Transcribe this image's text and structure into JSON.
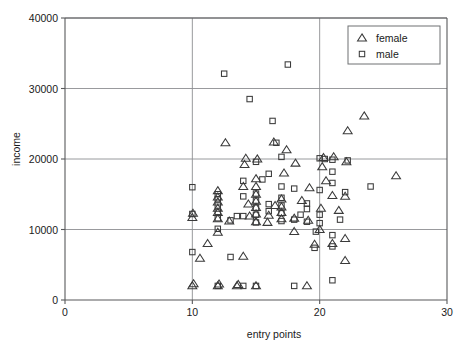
{
  "chart_data": {
    "type": "scatter",
    "title": "",
    "xlabel": "entry points",
    "ylabel": "income",
    "xlim": [
      0,
      30
    ],
    "ylim": [
      0,
      40000
    ],
    "xticks": [
      0,
      10,
      20,
      30
    ],
    "yticks": [
      0,
      10000,
      20000,
      30000,
      40000
    ],
    "xtick_labels": [
      "0",
      "10",
      "20",
      "30"
    ],
    "ytick_labels": [
      "0",
      "10000",
      "20000",
      "30000",
      "40000"
    ],
    "grid": "both-major",
    "legend_position": "top-right",
    "series": [
      {
        "name": "female",
        "marker": "triangle",
        "color": "#3a3a3a",
        "points": [
          [
            10.0,
            2000
          ],
          [
            10.1,
            2300
          ],
          [
            10.0,
            11700
          ],
          [
            10.05,
            12300
          ],
          [
            10.6,
            5900
          ],
          [
            11.2,
            8000
          ],
          [
            12.0,
            2000
          ],
          [
            12.1,
            2250
          ],
          [
            12.0,
            9600
          ],
          [
            12.0,
            11500
          ],
          [
            12.0,
            12400
          ],
          [
            12.0,
            13000
          ],
          [
            12.0,
            13900
          ],
          [
            12.0,
            14600
          ],
          [
            12.0,
            15500
          ],
          [
            12.6,
            22300
          ],
          [
            12.9,
            11200
          ],
          [
            13.5,
            2000
          ],
          [
            13.6,
            2200
          ],
          [
            14.0,
            6200
          ],
          [
            14.0,
            16100
          ],
          [
            14.1,
            19200
          ],
          [
            14.2,
            20100
          ],
          [
            14.4,
            13600
          ],
          [
            14.5,
            11900
          ],
          [
            15.0,
            2000
          ],
          [
            15.0,
            11100
          ],
          [
            15.0,
            12200
          ],
          [
            15.0,
            13100
          ],
          [
            15.0,
            14000
          ],
          [
            15.0,
            15000
          ],
          [
            15.0,
            16100
          ],
          [
            15.0,
            17200
          ],
          [
            15.1,
            20000
          ],
          [
            15.9,
            11000
          ],
          [
            16.0,
            12000
          ],
          [
            16.4,
            22400
          ],
          [
            16.5,
            13400
          ],
          [
            17.0,
            11500
          ],
          [
            17.0,
            12400
          ],
          [
            17.0,
            13200
          ],
          [
            17.0,
            14300
          ],
          [
            17.2,
            18000
          ],
          [
            17.4,
            21300
          ],
          [
            18.0,
            9700
          ],
          [
            18.0,
            11600
          ],
          [
            18.1,
            19400
          ],
          [
            18.6,
            14100
          ],
          [
            19.0,
            2000
          ],
          [
            19.1,
            11300
          ],
          [
            19.2,
            15900
          ],
          [
            19.6,
            7900
          ],
          [
            20.0,
            10000
          ],
          [
            20.1,
            13000
          ],
          [
            20.2,
            18900
          ],
          [
            20.3,
            20200
          ],
          [
            20.5,
            16900
          ],
          [
            21.0,
            8000
          ],
          [
            21.0,
            14800
          ],
          [
            21.1,
            20300
          ],
          [
            21.5,
            12700
          ],
          [
            22.0,
            5600
          ],
          [
            22.0,
            8700
          ],
          [
            22.0,
            14700
          ],
          [
            22.1,
            19600
          ],
          [
            22.2,
            24000
          ],
          [
            23.5,
            26100
          ],
          [
            26.0,
            17600
          ]
        ]
      },
      {
        "name": "male",
        "marker": "square",
        "color": "#3a3a3a",
        "points": [
          [
            10.0,
            6800
          ],
          [
            10.0,
            12200
          ],
          [
            10.0,
            16000
          ],
          [
            12.0,
            2000
          ],
          [
            12.0,
            10100
          ],
          [
            12.0,
            11600
          ],
          [
            12.0,
            12500
          ],
          [
            12.0,
            13400
          ],
          [
            12.0,
            14300
          ],
          [
            12.0,
            15000
          ],
          [
            12.5,
            32100
          ],
          [
            13.0,
            6100
          ],
          [
            13.0,
            11300
          ],
          [
            13.5,
            11900
          ],
          [
            14.0,
            2000
          ],
          [
            14.0,
            11900
          ],
          [
            14.0,
            14700
          ],
          [
            14.0,
            16900
          ],
          [
            14.5,
            28500
          ],
          [
            15.0,
            2000
          ],
          [
            15.0,
            11000
          ],
          [
            15.0,
            12100
          ],
          [
            15.0,
            13100
          ],
          [
            15.0,
            14100
          ],
          [
            15.0,
            15100
          ],
          [
            15.0,
            19600
          ],
          [
            15.5,
            17100
          ],
          [
            16.0,
            12600
          ],
          [
            16.0,
            13600
          ],
          [
            16.0,
            17900
          ],
          [
            16.3,
            25400
          ],
          [
            16.6,
            22300
          ],
          [
            17.0,
            11200
          ],
          [
            17.0,
            12300
          ],
          [
            17.0,
            13400
          ],
          [
            17.0,
            14500
          ],
          [
            17.0,
            16100
          ],
          [
            17.0,
            20300
          ],
          [
            17.5,
            33400
          ],
          [
            18.0,
            2000
          ],
          [
            18.0,
            11400
          ],
          [
            18.0,
            15800
          ],
          [
            18.5,
            12100
          ],
          [
            19.0,
            11100
          ],
          [
            19.0,
            12900
          ],
          [
            19.0,
            13700
          ],
          [
            19.6,
            7400
          ],
          [
            19.7,
            9700
          ],
          [
            20.0,
            10900
          ],
          [
            20.0,
            12100
          ],
          [
            20.0,
            15600
          ],
          [
            20.0,
            20100
          ],
          [
            20.4,
            20000
          ],
          [
            21.0,
            2800
          ],
          [
            21.0,
            7600
          ],
          [
            21.0,
            9200
          ],
          [
            21.0,
            16600
          ],
          [
            21.0,
            18200
          ],
          [
            21.0,
            19900
          ],
          [
            21.6,
            11400
          ],
          [
            22.0,
            15300
          ],
          [
            22.2,
            19800
          ],
          [
            24.0,
            16100
          ]
        ]
      }
    ]
  },
  "legend": {
    "entries": [
      {
        "label": "female",
        "marker": "triangle"
      },
      {
        "label": "male",
        "marker": "square"
      }
    ]
  }
}
